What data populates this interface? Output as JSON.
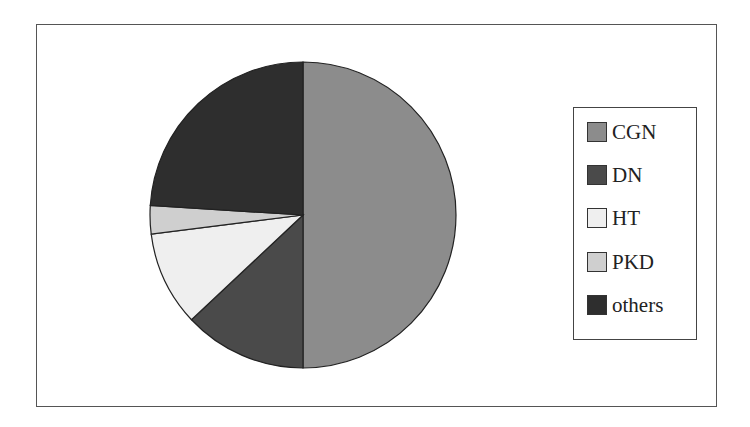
{
  "chart_data": {
    "type": "pie",
    "title": "",
    "start_angle_deg": 0,
    "direction": "clockwise",
    "categories": [
      "CGN",
      "DN",
      "HT",
      "PKD",
      "others"
    ],
    "values": [
      50,
      13,
      10,
      3,
      24
    ],
    "unit": "percent (estimated from slice angles)",
    "colors": [
      "#8c8c8c",
      "#4a4a4a",
      "#efefef",
      "#cfcfcf",
      "#2e2e2e"
    ],
    "legend_position": "right"
  },
  "legend": {
    "items": [
      {
        "label": "CGN",
        "color": "#8c8c8c"
      },
      {
        "label": "DN",
        "color": "#4a4a4a"
      },
      {
        "label": "HT",
        "color": "#efefef"
      },
      {
        "label": "PKD",
        "color": "#cfcfcf"
      },
      {
        "label": "others",
        "color": "#2e2e2e"
      }
    ]
  }
}
